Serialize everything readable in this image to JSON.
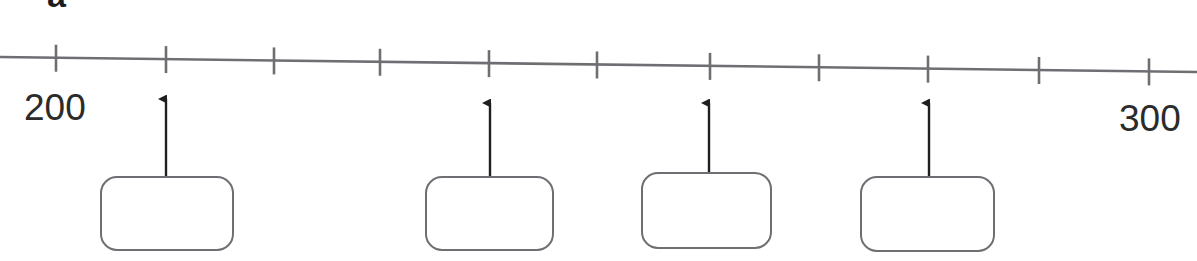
{
  "figure": {
    "panel_label": "a",
    "type": "number-line-diagram",
    "stroke_color": "#6e6e73",
    "text_color": "#2b2b2b"
  },
  "axis": {
    "start_label": "200",
    "end_label": "300",
    "min": 200,
    "max": 300,
    "tick_count": 11,
    "tick_interval": 10,
    "tick_values": [
      200,
      210,
      220,
      230,
      240,
      250,
      260,
      270,
      280,
      290,
      300
    ],
    "tick_x_positions": [
      56,
      166,
      274,
      380,
      489,
      597,
      710,
      819,
      928,
      1039,
      1149
    ],
    "line_y_left": 57,
    "line_y_right": 72,
    "tick_top": 44,
    "tick_bottom": 83
  },
  "markers": [
    {
      "name": "marker-1",
      "tick_index": 1,
      "value": 210,
      "arrow_x": 166,
      "arrow_tip_y": 90,
      "arrow_tail_y": 178,
      "box": {
        "x": 100,
        "y": 176,
        "width": 134,
        "height": 75,
        "text": ""
      }
    },
    {
      "name": "marker-2",
      "tick_index": 4,
      "value": 240,
      "arrow_x": 490,
      "arrow_tip_y": 94,
      "arrow_tail_y": 178,
      "box": {
        "x": 425,
        "y": 176,
        "width": 129,
        "height": 75,
        "text": ""
      }
    },
    {
      "name": "marker-3",
      "tick_index": 6,
      "value": 260,
      "arrow_x": 709,
      "arrow_tip_y": 94,
      "arrow_tail_y": 174,
      "box": {
        "x": 641,
        "y": 172,
        "width": 131,
        "height": 77,
        "text": ""
      }
    },
    {
      "name": "marker-4",
      "tick_index": 8,
      "value": 280,
      "arrow_x": 929,
      "arrow_tip_y": 94,
      "arrow_tail_y": 178,
      "box": {
        "x": 860,
        "y": 176,
        "width": 135,
        "height": 76,
        "text": ""
      }
    }
  ]
}
